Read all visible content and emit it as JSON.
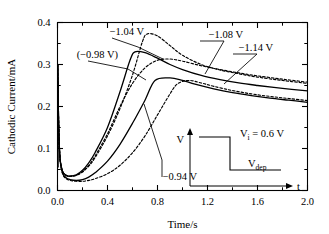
{
  "figure": {
    "name": "chronoamperometry-current-transients",
    "background": "#ffffff",
    "line_color": "#000000"
  },
  "axes": {
    "xlabel": "Time/s",
    "ylabel": "Cathodic Current/mA",
    "xticks": [
      "0.0",
      "0.4",
      "0.8",
      "1.2",
      "1.6",
      "2.0"
    ],
    "yticks": [
      "0.0",
      "0.1",
      "0.2",
      "0.3",
      "0.4"
    ],
    "xlim": [
      0.0,
      2.0
    ],
    "ylim": [
      0.0,
      0.4
    ]
  },
  "annotations": {
    "a": {
      "text": "−1.04 V"
    },
    "b": {
      "text": "(−0.98 V)"
    },
    "c": {
      "text": "−1.08 V"
    },
    "d": {
      "text": "−1.14 V"
    },
    "e": {
      "text": "−0.94 V"
    }
  },
  "inset": {
    "name": "potential-step-waveform",
    "v_axis_label": "V",
    "t_axis_label": "t",
    "initial_label": "V",
    "initial_sub": "i",
    "initial_value": " = 0.6 V",
    "dep_label": "V",
    "dep_sub": "dep"
  },
  "chart_data": {
    "type": "line",
    "title": "",
    "xlabel": "Time/s",
    "ylabel": "Cathodic Current/mA",
    "xlim": [
      0.0,
      2.0
    ],
    "ylim": [
      0.0,
      0.4
    ],
    "xticks": [
      0.0,
      0.4,
      0.8,
      1.2,
      1.6,
      2.0
    ],
    "yticks": [
      0.0,
      0.1,
      0.2,
      0.3,
      0.4
    ],
    "grid": false,
    "legend": "annotated-inline",
    "series": [
      {
        "name": "-0.94 V",
        "label": "−0.94 V",
        "style": "dashed",
        "peak": {
          "t": 0.96,
          "i": 0.254
        },
        "x": [
          0.0,
          0.01,
          0.02,
          0.04,
          0.07,
          0.1,
          0.15,
          0.2,
          0.25,
          0.3,
          0.4,
          0.5,
          0.6,
          0.7,
          0.8,
          0.9,
          0.96,
          1.05,
          1.15,
          1.25,
          1.4,
          1.55,
          1.7,
          1.85,
          2.0
        ],
        "y": [
          0.3,
          0.15,
          0.075,
          0.04,
          0.028,
          0.024,
          0.022,
          0.022,
          0.024,
          0.028,
          0.04,
          0.06,
          0.09,
          0.13,
          0.18,
          0.23,
          0.254,
          0.262,
          0.256,
          0.248,
          0.238,
          0.23,
          0.224,
          0.219,
          0.214
        ]
      },
      {
        "name": "-0.98 V",
        "label": "(−0.98 V)",
        "style": "solid",
        "peak": {
          "t": 0.78,
          "i": 0.262
        },
        "x": [
          0.0,
          0.01,
          0.02,
          0.04,
          0.07,
          0.1,
          0.15,
          0.2,
          0.25,
          0.3,
          0.4,
          0.5,
          0.6,
          0.7,
          0.78,
          0.9,
          1.0,
          1.1,
          1.25,
          1.4,
          1.55,
          1.7,
          1.85,
          2.0
        ],
        "y": [
          0.3,
          0.15,
          0.075,
          0.042,
          0.03,
          0.026,
          0.024,
          0.026,
          0.032,
          0.042,
          0.07,
          0.11,
          0.16,
          0.215,
          0.262,
          0.268,
          0.262,
          0.253,
          0.242,
          0.233,
          0.226,
          0.22,
          0.215,
          0.21
        ]
      },
      {
        "name": "-1.04 V",
        "label": "−1.04 V",
        "style": "dashed",
        "peak": {
          "t": 0.72,
          "i": 0.373
        },
        "x": [
          0.0,
          0.01,
          0.02,
          0.04,
          0.07,
          0.1,
          0.15,
          0.2,
          0.25,
          0.3,
          0.4,
          0.5,
          0.6,
          0.68,
          0.72,
          0.8,
          0.9,
          1.0,
          1.15,
          1.3,
          1.45,
          1.6,
          1.8,
          2.0
        ],
        "y": [
          0.3,
          0.15,
          0.078,
          0.046,
          0.036,
          0.034,
          0.036,
          0.044,
          0.058,
          0.078,
          0.13,
          0.195,
          0.275,
          0.355,
          0.373,
          0.368,
          0.345,
          0.322,
          0.3,
          0.287,
          0.278,
          0.27,
          0.262,
          0.255
        ]
      },
      {
        "name": "-1.08 V",
        "label": "−1.08 V",
        "style": "solid",
        "peak": {
          "t": 0.62,
          "i": 0.33
        },
        "x": [
          0.0,
          0.01,
          0.02,
          0.04,
          0.07,
          0.1,
          0.15,
          0.2,
          0.25,
          0.3,
          0.4,
          0.5,
          0.58,
          0.62,
          0.7,
          0.8,
          0.9,
          1.0,
          1.15,
          1.3,
          1.45,
          1.6,
          1.8,
          2.0
        ],
        "y": [
          0.3,
          0.15,
          0.078,
          0.046,
          0.036,
          0.034,
          0.037,
          0.048,
          0.066,
          0.09,
          0.15,
          0.235,
          0.31,
          0.33,
          0.328,
          0.315,
          0.3,
          0.288,
          0.274,
          0.264,
          0.256,
          0.25,
          0.243,
          0.237
        ]
      },
      {
        "name": "-1.14 V",
        "label": "−1.14 V",
        "style": "dashed",
        "peak": {
          "t": 0.8,
          "i": 0.31
        },
        "x": [
          0.0,
          0.01,
          0.02,
          0.04,
          0.07,
          0.1,
          0.15,
          0.2,
          0.25,
          0.3,
          0.4,
          0.5,
          0.6,
          0.7,
          0.8,
          0.9,
          1.0,
          1.15,
          1.3,
          1.45,
          1.6,
          1.8,
          2.0
        ],
        "y": [
          0.3,
          0.15,
          0.078,
          0.046,
          0.036,
          0.034,
          0.036,
          0.045,
          0.06,
          0.082,
          0.135,
          0.2,
          0.255,
          0.292,
          0.31,
          0.313,
          0.308,
          0.297,
          0.288,
          0.28,
          0.273,
          0.265,
          0.258
        ]
      }
    ]
  }
}
